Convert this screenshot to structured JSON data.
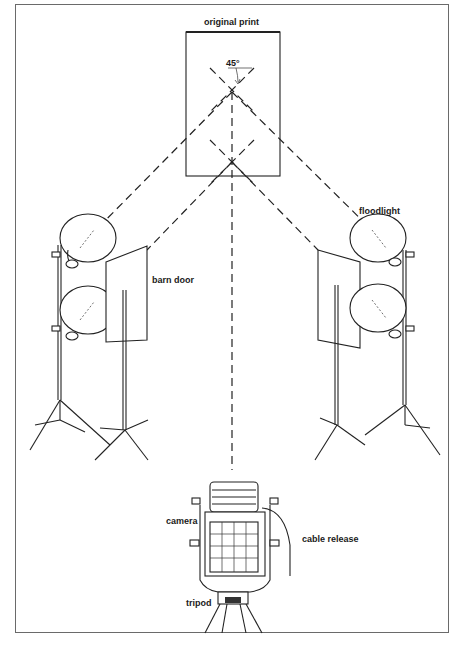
{
  "diagram": {
    "labels": {
      "original_print": "original print",
      "angle": "45°",
      "barn_door": "barn door",
      "floodlight": "floodlight",
      "camera": "camera",
      "cable_release": "cable release",
      "tripod": "tripod"
    },
    "elements": [
      {
        "id": "original-print",
        "type": "rectangle"
      },
      {
        "id": "left-floodlights",
        "count": 2
      },
      {
        "id": "right-floodlights",
        "count": 2
      },
      {
        "id": "left-barn-door"
      },
      {
        "id": "right-barn-door"
      },
      {
        "id": "camera"
      },
      {
        "id": "tripod"
      },
      {
        "id": "cable-release"
      }
    ],
    "colors": {
      "line": "#222222",
      "frame": "#6a6a6a",
      "background": "#ffffff"
    }
  }
}
